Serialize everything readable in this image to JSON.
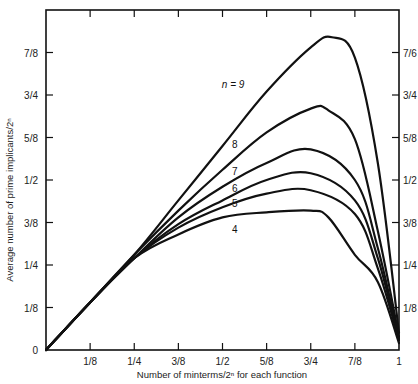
{
  "chart_data": {
    "type": "line",
    "title": "",
    "xlabel": "Number of minterms/2^n for each function",
    "ylabel": "Average number of prime implicants/2^n",
    "xlim": [
      0,
      1
    ],
    "ylim": [
      0,
      1
    ],
    "grid": false,
    "legend": "inline curve labels",
    "x_ticks": [
      "1/8",
      "1/4",
      "3/8",
      "1/2",
      "5/8",
      "3/4",
      "7/8",
      "1"
    ],
    "x_origin_label": "0",
    "y_ticks_left": [
      "1/8",
      "1/4",
      "3/8",
      "1/2",
      "5/8",
      "3/4",
      "7/8"
    ],
    "y_origin_label": "0",
    "y_ticks_right": [
      "1/8",
      "1/4",
      "3/8",
      "1/2",
      "5/8",
      "3/4",
      "7/6"
    ],
    "series": [
      {
        "name": "n = 9",
        "label": "n = 9",
        "x": [
          0,
          0.125,
          0.25,
          0.375,
          0.5,
          0.625,
          0.75,
          0.81,
          0.875,
          0.94,
          1
        ],
        "y": [
          0,
          0.14,
          0.28,
          0.44,
          0.6,
          0.76,
          0.89,
          0.92,
          0.86,
          0.55,
          0.05
        ]
      },
      {
        "name": "n = 8",
        "label": "8",
        "x": [
          0,
          0.125,
          0.25,
          0.375,
          0.5,
          0.625,
          0.75,
          0.8,
          0.875,
          0.94,
          1
        ],
        "y": [
          0,
          0.14,
          0.28,
          0.41,
          0.53,
          0.64,
          0.71,
          0.705,
          0.62,
          0.35,
          0.04
        ]
      },
      {
        "name": "n = 7",
        "label": "7",
        "x": [
          0,
          0.125,
          0.25,
          0.375,
          0.5,
          0.625,
          0.75,
          0.875,
          0.94,
          1
        ],
        "y": [
          0,
          0.14,
          0.27,
          0.39,
          0.48,
          0.55,
          0.59,
          0.5,
          0.3,
          0.03
        ]
      },
      {
        "name": "n = 6",
        "label": "6",
        "x": [
          0,
          0.125,
          0.25,
          0.375,
          0.5,
          0.625,
          0.75,
          0.875,
          0.94,
          1
        ],
        "y": [
          0,
          0.14,
          0.27,
          0.37,
          0.44,
          0.5,
          0.52,
          0.44,
          0.27,
          0.03
        ]
      },
      {
        "name": "n = 5",
        "label": "5",
        "x": [
          0,
          0.125,
          0.25,
          0.375,
          0.5,
          0.625,
          0.75,
          0.875,
          0.94,
          1
        ],
        "y": [
          0,
          0.14,
          0.27,
          0.36,
          0.42,
          0.46,
          0.47,
          0.4,
          0.24,
          0.03
        ]
      },
      {
        "name": "n = 4",
        "label": "4",
        "x": [
          0,
          0.125,
          0.25,
          0.375,
          0.5,
          0.625,
          0.75,
          0.8,
          0.875,
          0.94,
          1
        ],
        "y": [
          0,
          0.14,
          0.27,
          0.34,
          0.39,
          0.405,
          0.41,
          0.39,
          0.28,
          0.2,
          0.02
        ]
      }
    ]
  }
}
